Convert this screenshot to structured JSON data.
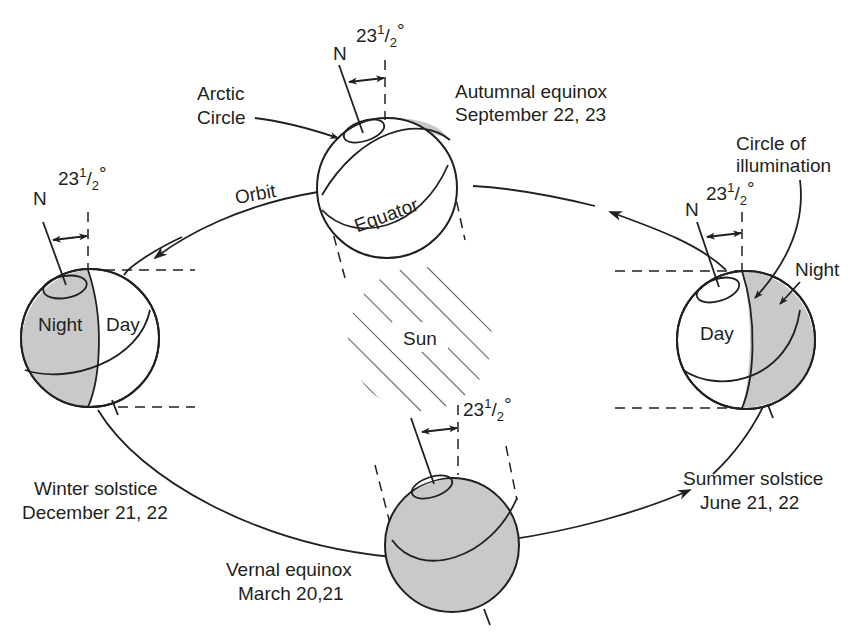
{
  "diagram": {
    "center": {
      "label": "Sun"
    },
    "orbit_label": "Orbit",
    "tilt": {
      "whole": "23",
      "sup": "1",
      "sub": "2",
      "deg": "°"
    },
    "pole_label": "N",
    "positions": {
      "autumnal": {
        "line1": "Autumnal equinox",
        "line2": "September 22, 23",
        "equator": "Equator",
        "arctic_line1": "Arctic",
        "arctic_line2": "Circle"
      },
      "winter": {
        "line1": "Winter solstice",
        "line2": "December 21, 22",
        "night": "Night",
        "day": "Day"
      },
      "summer": {
        "line1": "Summer solstice",
        "line2": "June 21, 22",
        "night": "Night",
        "day": "Day",
        "illum_line1": "Circle of",
        "illum_line2": "illumination"
      },
      "vernal": {
        "line1": "Vernal equinox",
        "line2": "March 20,21"
      }
    },
    "colors": {
      "ink": "#231f20",
      "night_shade": "#c9c9c9",
      "background": "#ffffff"
    }
  }
}
